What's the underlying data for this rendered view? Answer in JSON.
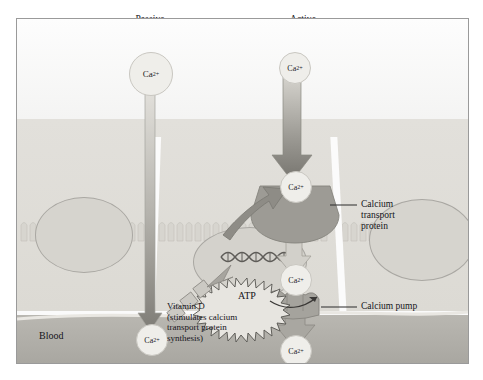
{
  "figure": {
    "title_top_left": "Passive\ndiffusion",
    "title_top_right": "Active\ntransport"
  },
  "labels": {
    "passive_diffusion_l1": "Passive",
    "passive_diffusion_l2": "diffusion",
    "active_transport_l1": "Active",
    "active_transport_l2": "transport",
    "calcium_transport_protein_l1": "Calcium",
    "calcium_transport_protein_l2": "transport",
    "calcium_transport_protein_l3": "protein",
    "calcium_pump": "Calcium pump",
    "blood": "Blood",
    "vitamin_d_l1": "Vitamin D",
    "vitamin_d_l2": "(stimulates calcium",
    "vitamin_d_l3": "transport protein",
    "vitamin_d_l4": "synthesis)",
    "atp": "ATP"
  },
  "ions": {
    "ca_symbol": "Ca",
    "ca_charge": "2+",
    "passive_top": "Ca",
    "active_top": "Ca",
    "active_apical": "Ca",
    "active_mid": "Ca",
    "blood_left": "Ca",
    "blood_right": "Ca"
  },
  "structures": {
    "lumen": "intestinal-lumen",
    "brush_border": "microvilli-brush-border",
    "epithelial_cell": "intestinal-epithelial-cell",
    "nucleus": "cell-nucleus",
    "dna": "dna-double-helix",
    "blood_vessel": "blood-compartment"
  },
  "colors": {
    "background": "#fbfbfb",
    "lumen": "#fdfdfd",
    "epithelium": "#e0ded9",
    "blood": "#b2b0aa",
    "nucleus": "#d5d3cd",
    "protein": "#9d9b95",
    "arrow_dark": "#8e8c86",
    "arrow_light": "#cfcdc7",
    "ion_fill": "#efeeea",
    "text": "#17161a",
    "frame_border": "#9a9a9a"
  }
}
